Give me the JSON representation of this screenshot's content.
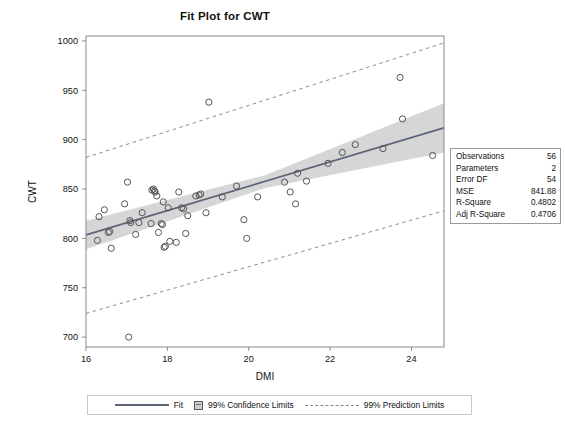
{
  "chart_data": {
    "type": "scatter",
    "title": "Fit Plot for CWT",
    "xlabel": "DMI",
    "ylabel": "CWT",
    "xlim": [
      16.0,
      24.8
    ],
    "ylim": [
      690,
      1005
    ],
    "xticks": [
      16,
      18,
      20,
      22,
      24
    ],
    "yticks": [
      700,
      750,
      800,
      850,
      900,
      950,
      1000
    ],
    "grid": false,
    "legend_position": "bottom",
    "points": [
      {
        "x": 16.28,
        "y": 798
      },
      {
        "x": 16.32,
        "y": 822
      },
      {
        "x": 16.45,
        "y": 829
      },
      {
        "x": 16.55,
        "y": 806
      },
      {
        "x": 16.58,
        "y": 807
      },
      {
        "x": 16.62,
        "y": 790
      },
      {
        "x": 16.95,
        "y": 835
      },
      {
        "x": 17.02,
        "y": 857
      },
      {
        "x": 17.05,
        "y": 700
      },
      {
        "x": 17.08,
        "y": 818
      },
      {
        "x": 17.1,
        "y": 816
      },
      {
        "x": 17.22,
        "y": 804
      },
      {
        "x": 17.3,
        "y": 816
      },
      {
        "x": 17.38,
        "y": 826
      },
      {
        "x": 17.6,
        "y": 815
      },
      {
        "x": 17.62,
        "y": 849
      },
      {
        "x": 17.66,
        "y": 850
      },
      {
        "x": 17.68,
        "y": 848
      },
      {
        "x": 17.7,
        "y": 847
      },
      {
        "x": 17.74,
        "y": 843
      },
      {
        "x": 17.78,
        "y": 806
      },
      {
        "x": 17.85,
        "y": 815
      },
      {
        "x": 17.88,
        "y": 814
      },
      {
        "x": 17.9,
        "y": 837
      },
      {
        "x": 17.92,
        "y": 791
      },
      {
        "x": 17.95,
        "y": 792
      },
      {
        "x": 18.02,
        "y": 831
      },
      {
        "x": 18.06,
        "y": 797
      },
      {
        "x": 18.22,
        "y": 796
      },
      {
        "x": 18.28,
        "y": 847
      },
      {
        "x": 18.35,
        "y": 831
      },
      {
        "x": 18.4,
        "y": 830
      },
      {
        "x": 18.45,
        "y": 805
      },
      {
        "x": 18.5,
        "y": 823
      },
      {
        "x": 18.7,
        "y": 843
      },
      {
        "x": 18.78,
        "y": 844
      },
      {
        "x": 18.82,
        "y": 845
      },
      {
        "x": 18.95,
        "y": 826
      },
      {
        "x": 19.02,
        "y": 938
      },
      {
        "x": 19.35,
        "y": 842
      },
      {
        "x": 19.7,
        "y": 853
      },
      {
        "x": 19.88,
        "y": 819
      },
      {
        "x": 19.95,
        "y": 800
      },
      {
        "x": 20.22,
        "y": 842
      },
      {
        "x": 20.88,
        "y": 857
      },
      {
        "x": 21.02,
        "y": 847
      },
      {
        "x": 21.15,
        "y": 835
      },
      {
        "x": 21.2,
        "y": 866
      },
      {
        "x": 21.42,
        "y": 858
      },
      {
        "x": 21.95,
        "y": 876
      },
      {
        "x": 22.3,
        "y": 887
      },
      {
        "x": 22.62,
        "y": 895
      },
      {
        "x": 23.3,
        "y": 891
      },
      {
        "x": 23.72,
        "y": 963
      },
      {
        "x": 23.78,
        "y": 921
      },
      {
        "x": 24.52,
        "y": 884
      }
    ],
    "fit_line": {
      "x": [
        16.0,
        24.8
      ],
      "y": [
        803.5,
        912.0
      ]
    },
    "confidence_limits_99": {
      "x": [
        16.0,
        20.4,
        24.8
      ],
      "upper": [
        818.0,
        864.0,
        937.0
      ],
      "lower": [
        789.0,
        851.0,
        887.0
      ]
    },
    "prediction_limits_99": {
      "x": [
        16.0,
        24.8
      ],
      "upper": [
        882.0,
        998.0
      ],
      "lower": [
        724.0,
        828.0
      ]
    }
  },
  "stats_box": {
    "rows": [
      {
        "label": "Observations",
        "value": "56"
      },
      {
        "label": "Parameters",
        "value": "2"
      },
      {
        "label": "Error DF",
        "value": "54"
      },
      {
        "label": "MSE",
        "value": "841.88"
      },
      {
        "label": "R-Square",
        "value": "0.4802"
      },
      {
        "label": "Adj R-Square",
        "value": "0.4706"
      }
    ]
  },
  "legend": {
    "items": [
      {
        "label": "Fit",
        "marker": "solid-line"
      },
      {
        "label": "99% Confidence Limits",
        "marker": "filled-square"
      },
      {
        "label": "99% Prediction Limits",
        "marker": "dashed-line"
      }
    ]
  },
  "colors": {
    "fit_line": "#5a6475",
    "band_fill": "#cfcfcf",
    "prediction_line": "#8c8c8c",
    "marker_stroke": "#555555",
    "axis": "#8a8a8a",
    "text": "#111111"
  }
}
